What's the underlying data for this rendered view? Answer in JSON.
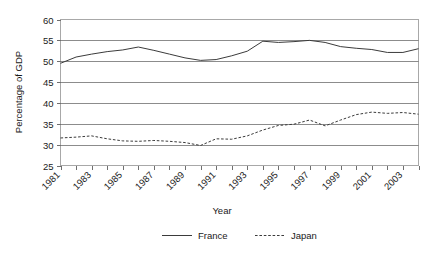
{
  "chart_data": {
    "type": "line",
    "title": "",
    "xlabel": "Year",
    "ylabel": "Percentage of GDP",
    "ylim": [
      25,
      60
    ],
    "ytick_step": 5,
    "yticks": [
      "25",
      "30",
      "35",
      "40",
      "45",
      "50",
      "55",
      "60"
    ],
    "grid": true,
    "legend_position": "bottom",
    "x": [
      1981,
      1982,
      1983,
      1984,
      1985,
      1986,
      1987,
      1988,
      1989,
      1990,
      1991,
      1992,
      1993,
      1994,
      1995,
      1996,
      1997,
      1998,
      1999,
      2000,
      2001,
      2002,
      2003,
      2004
    ],
    "xtick_labels": [
      "1981",
      "1983",
      "1985",
      "1987",
      "1989",
      "1991",
      "1993",
      "1995",
      "1997",
      "1999",
      "2001",
      "2003"
    ],
    "series": [
      {
        "name": "France",
        "style": "solid",
        "color": "#3b3b3b",
        "values": [
          49.5,
          51.0,
          51.7,
          52.3,
          52.7,
          53.4,
          52.6,
          51.7,
          50.8,
          50.2,
          50.4,
          51.3,
          52.4,
          54.8,
          54.5,
          54.7,
          55.0,
          54.5,
          53.5,
          53.1,
          52.8,
          52.1,
          52.1,
          53.0
        ]
      },
      {
        "name": "Japan",
        "style": "dashed",
        "color": "#3b3b3b",
        "values": [
          31.6,
          31.8,
          32.1,
          31.4,
          30.9,
          30.8,
          31.0,
          30.8,
          30.5,
          29.8,
          31.4,
          31.3,
          32.1,
          33.5,
          34.6,
          34.9,
          35.9,
          34.5,
          35.9,
          37.2,
          37.8,
          37.5,
          37.7,
          37.3
        ]
      }
    ],
    "legend": [
      {
        "label": "France",
        "style": "solid"
      },
      {
        "label": "Japan",
        "style": "dashed"
      }
    ]
  }
}
